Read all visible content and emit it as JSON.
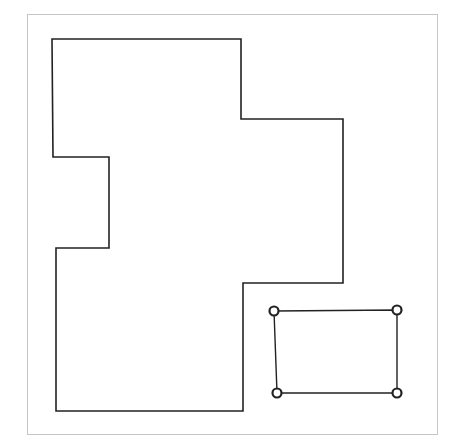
{
  "canvas": {
    "width": 450,
    "height": 436,
    "background": "#ffffff"
  },
  "frame": {
    "x": 27,
    "y": 14,
    "width": 410,
    "height": 420,
    "stroke": "#8a8a8a",
    "style": "dotted"
  },
  "main_shape": {
    "stroke": "#222222",
    "stroke_width": 1.6,
    "points": [
      [
        52,
        39
      ],
      [
        241,
        39
      ],
      [
        241,
        119
      ],
      [
        343,
        119
      ],
      [
        343,
        283
      ],
      [
        243,
        283
      ],
      [
        243,
        411
      ],
      [
        56,
        411
      ],
      [
        56,
        248
      ],
      [
        109,
        248
      ],
      [
        109,
        157
      ],
      [
        53,
        157
      ]
    ]
  },
  "selected_rect": {
    "stroke": "#222222",
    "stroke_width": 1.4,
    "corners": [
      [
        274,
        311
      ],
      [
        397,
        310
      ],
      [
        397,
        393
      ],
      [
        277,
        393
      ]
    ],
    "handle_radius": 4.5,
    "handle_stroke_width": 2.2
  }
}
